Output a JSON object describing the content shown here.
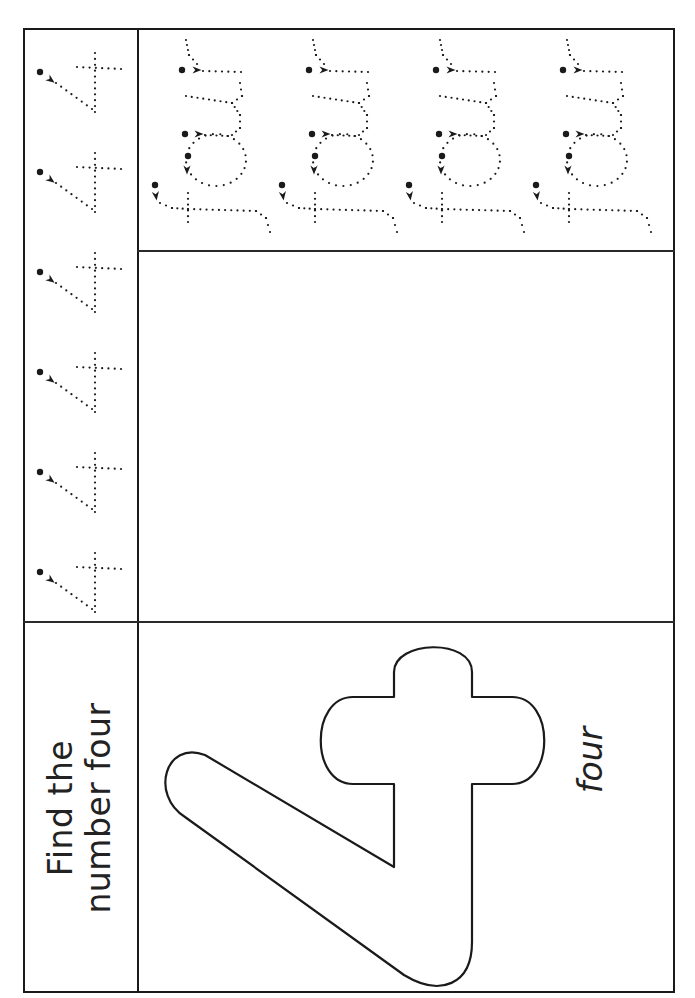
{
  "worksheet": {
    "title_line1": "Find the",
    "title_line2": "number four",
    "number_word": "four",
    "number_digit": "4",
    "trace_digits_count": 6,
    "trace_words": [
      "four",
      "four",
      "four",
      "four"
    ],
    "colors": {
      "ink": "#1a1a1a",
      "paper": "#ffffff"
    }
  }
}
